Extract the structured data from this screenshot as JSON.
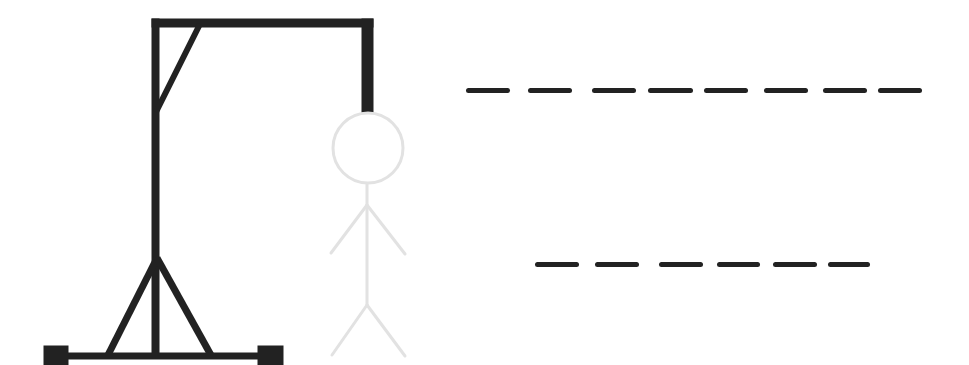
{
  "game": {
    "name": "Hangman",
    "gallows_color": "#222222",
    "figure_color": "#e2e2e2",
    "wrong_guesses_shown": 0
  },
  "word_rows": [
    {
      "id": "row-1",
      "letter_count": 8,
      "y": 88,
      "slots": [
        {
          "x": 466,
          "w": 44,
          "letter": ""
        },
        {
          "x": 528,
          "w": 44,
          "letter": ""
        },
        {
          "x": 592,
          "w": 44,
          "letter": ""
        },
        {
          "x": 648,
          "w": 45,
          "letter": ""
        },
        {
          "x": 704,
          "w": 44,
          "letter": ""
        },
        {
          "x": 764,
          "w": 44,
          "letter": ""
        },
        {
          "x": 823,
          "w": 44,
          "letter": ""
        },
        {
          "x": 878,
          "w": 44,
          "letter": ""
        }
      ]
    },
    {
      "id": "row-2",
      "letter_count": 6,
      "y": 262,
      "slots": [
        {
          "x": 535,
          "w": 44,
          "letter": ""
        },
        {
          "x": 595,
          "w": 44,
          "letter": ""
        },
        {
          "x": 659,
          "w": 44,
          "letter": ""
        },
        {
          "x": 717,
          "w": 43,
          "letter": ""
        },
        {
          "x": 773,
          "w": 44,
          "letter": ""
        },
        {
          "x": 828,
          "w": 42,
          "letter": ""
        }
      ]
    }
  ]
}
